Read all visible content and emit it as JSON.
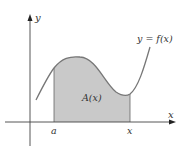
{
  "figure": {
    "y_axis_label": "y",
    "x_axis_label": "x",
    "curve_label": "y = f(x)",
    "area_label": "A(x)",
    "lower_bound_label": "a",
    "upper_bound_label": "x"
  },
  "colors": {
    "axis": "#444444",
    "curve": "#777777",
    "shade": "#c9c9c9",
    "text": "#333333"
  }
}
